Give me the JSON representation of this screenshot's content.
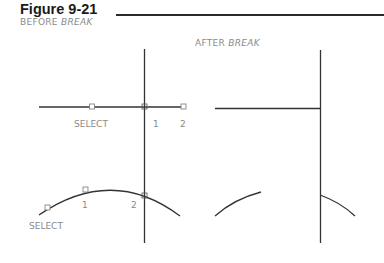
{
  "figure": {
    "title": "Figure 9-21",
    "before_caption": {
      "prefix": "BEFORE",
      "command": "BREAK"
    },
    "after_caption": {
      "prefix": "AFTER",
      "command": "BREAK"
    }
  },
  "before": {
    "line_labels": {
      "select": "SELECT",
      "point1": "1",
      "point2": "2"
    },
    "arc_labels": {
      "select": "SELECT",
      "point1": "1",
      "point2": "2"
    }
  },
  "colors": {
    "line": "#333333",
    "label": "#8a8a8a",
    "title": "#1a1a1a"
  }
}
